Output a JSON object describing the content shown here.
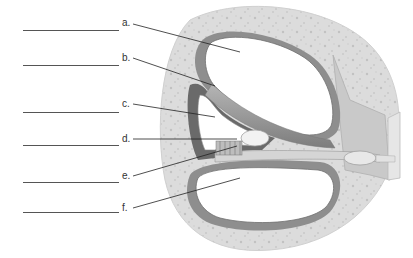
{
  "diagram": {
    "labels": [
      {
        "id": "a",
        "text": "a.",
        "blank_y": 30,
        "label_x": 122,
        "label_y": 19,
        "line": [
          133,
          24,
          240,
          52
        ]
      },
      {
        "id": "b",
        "text": "b.",
        "blank_y": 65,
        "label_x": 122,
        "label_y": 54,
        "line": [
          133,
          58,
          215,
          86
        ]
      },
      {
        "id": "c",
        "text": "c.",
        "blank_y": 112,
        "label_x": 122,
        "label_y": 100,
        "line": [
          133,
          104,
          215,
          117
        ]
      },
      {
        "id": "d",
        "text": "d.",
        "blank_y": 145,
        "label_x": 122,
        "label_y": 135,
        "line": [
          133,
          139,
          237,
          139
        ]
      },
      {
        "id": "e",
        "text": "e.",
        "blank_y": 182,
        "label_x": 122,
        "label_y": 172,
        "line": [
          133,
          176,
          237,
          146
        ]
      },
      {
        "id": "f",
        "text": "f.",
        "blank_y": 212,
        "label_x": 122,
        "label_y": 205,
        "line": [
          133,
          208,
          240,
          178
        ]
      }
    ],
    "colors": {
      "bone": "#dcdcdc",
      "bone_speckle": "#c4c4c4",
      "membrane": "#9a9a9a",
      "membrane_dark": "#6e6e6e",
      "chamber": "#ffffff",
      "leader_line": "#222222",
      "blank_line": "#555555"
    }
  }
}
